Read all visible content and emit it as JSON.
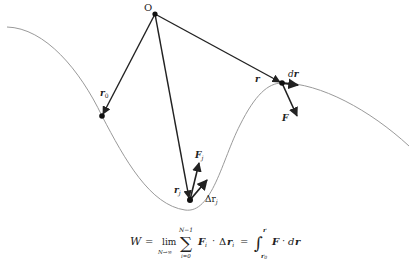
{
  "diagram": {
    "origin_label": "O",
    "labels": {
      "r0": "r",
      "r0_sub": "0",
      "rj": "r",
      "rj_sub": "j",
      "Fj": "F",
      "Fj_sub": "j",
      "delta_rj": "Δr",
      "delta_rj_sub": "j",
      "r": "r",
      "dr_d": "d",
      "dr_r": "r",
      "F": "F"
    },
    "colors": {
      "curve": "#9a9a9a",
      "vector": "#222222",
      "point": "#111111"
    }
  },
  "formula": {
    "W": "W",
    "eq1": "=",
    "lim": "lim",
    "lim_sub": "N→∞",
    "sum": "∑",
    "sum_top": "N−1",
    "sum_bottom": "i=0",
    "Fi": "F",
    "Fi_sub": "i",
    "dot1": "·",
    "delta": "Δ",
    "ri": "r",
    "ri_sub": "i",
    "eq2": "=",
    "integral": "∫",
    "int_top": "r",
    "int_bottom": "r",
    "int_bottom_sub": "0",
    "F": "F",
    "dot2": "·",
    "d": "d",
    "r": "r"
  }
}
